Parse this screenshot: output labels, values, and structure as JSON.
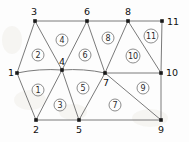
{
  "figure": {
    "width": 189,
    "height": 142,
    "background_color": "#fdfdfd",
    "edge_color": "#6b6b6b",
    "node_color": "#1a1a1a",
    "label_color": "#0f0f0f"
  },
  "nodes": [
    {
      "id": "1",
      "label": "1",
      "x": 17,
      "y": 73,
      "label_x": 8,
      "label_y": 76
    },
    {
      "id": "2",
      "label": "2",
      "x": 36,
      "y": 120,
      "label_x": 33,
      "label_y": 133
    },
    {
      "id": "3",
      "label": "3",
      "x": 35,
      "y": 21,
      "label_x": 31,
      "label_y": 15
    },
    {
      "id": "4",
      "label": "4",
      "x": 62,
      "y": 70,
      "label_x": 59,
      "label_y": 65
    },
    {
      "id": "5",
      "label": "5",
      "x": 79,
      "y": 120,
      "label_x": 76,
      "label_y": 133
    },
    {
      "id": "6",
      "label": "6",
      "x": 87,
      "y": 21,
      "label_x": 84,
      "label_y": 15
    },
    {
      "id": "7",
      "label": "7",
      "x": 105,
      "y": 73,
      "label_x": 103,
      "label_y": 86
    },
    {
      "id": "8",
      "label": "8",
      "x": 128,
      "y": 21,
      "label_x": 125,
      "label_y": 15
    },
    {
      "id": "9",
      "label": "9",
      "x": 161,
      "y": 120,
      "label_x": 158,
      "label_y": 133
    },
    {
      "id": "10",
      "label": "10",
      "x": 161,
      "y": 73,
      "label_x": 166,
      "label_y": 76
    },
    {
      "id": "11",
      "label": "11",
      "x": 162,
      "y": 21,
      "label_x": 167,
      "label_y": 25
    }
  ],
  "edges": [
    {
      "from": "3",
      "to": "6",
      "style": "straight"
    },
    {
      "from": "6",
      "to": "8",
      "style": "straight"
    },
    {
      "from": "8",
      "to": "11",
      "style": "straight"
    },
    {
      "from": "11",
      "to": "10",
      "style": "straight"
    },
    {
      "from": "10",
      "to": "9",
      "style": "straight"
    },
    {
      "from": "9",
      "to": "5",
      "style": "straight"
    },
    {
      "from": "5",
      "to": "2",
      "style": "straight"
    },
    {
      "from": "2",
      "to": "1",
      "style": "straight"
    },
    {
      "from": "1",
      "to": "3",
      "style": "straight"
    },
    {
      "from": "3",
      "to": "4",
      "style": "straight"
    },
    {
      "from": "1",
      "to": "4",
      "style": "curved"
    },
    {
      "from": "4",
      "to": "7",
      "style": "curved"
    },
    {
      "from": "4",
      "to": "2",
      "style": "straight"
    },
    {
      "from": "4",
      "to": "5",
      "style": "straight"
    },
    {
      "from": "4",
      "to": "6",
      "style": "straight"
    },
    {
      "from": "6",
      "to": "7",
      "style": "straight"
    },
    {
      "from": "7",
      "to": "8",
      "style": "straight"
    },
    {
      "from": "7",
      "to": "5",
      "style": "straight"
    },
    {
      "from": "7",
      "to": "9",
      "style": "straight"
    },
    {
      "from": "7",
      "to": "10",
      "style": "straight"
    },
    {
      "from": "8",
      "to": "10",
      "style": "straight"
    }
  ],
  "elements": [
    {
      "id": "1",
      "label": "1",
      "x": 38,
      "y": 90,
      "nodes": [
        "1",
        "2",
        "4"
      ]
    },
    {
      "id": "2",
      "label": "2",
      "x": 38,
      "y": 55,
      "nodes": [
        "1",
        "4",
        "3"
      ]
    },
    {
      "id": "3",
      "label": "3",
      "x": 60,
      "y": 105,
      "nodes": [
        "2",
        "5",
        "4"
      ]
    },
    {
      "id": "4",
      "label": "4",
      "x": 62,
      "y": 40,
      "nodes": [
        "3",
        "6",
        "4"
      ]
    },
    {
      "id": "5",
      "label": "5",
      "x": 83,
      "y": 88,
      "nodes": [
        "4",
        "5",
        "7"
      ]
    },
    {
      "id": "6",
      "label": "6",
      "x": 85,
      "y": 55,
      "nodes": [
        "4",
        "7",
        "6"
      ]
    },
    {
      "id": "7",
      "label": "7",
      "x": 115,
      "y": 105,
      "nodes": [
        "5",
        "9",
        "7"
      ]
    },
    {
      "id": "8",
      "label": "8",
      "x": 108,
      "y": 38,
      "nodes": [
        "6",
        "8",
        "7"
      ]
    },
    {
      "id": "9",
      "label": "9",
      "x": 143,
      "y": 88,
      "nodes": [
        "7",
        "9",
        "10"
      ]
    },
    {
      "id": "10",
      "label": "10",
      "x": 133,
      "y": 56,
      "nodes": [
        "7",
        "10",
        "8"
      ]
    },
    {
      "id": "11",
      "label": "11",
      "x": 151,
      "y": 36,
      "nodes": [
        "8",
        "10",
        "11"
      ]
    }
  ]
}
